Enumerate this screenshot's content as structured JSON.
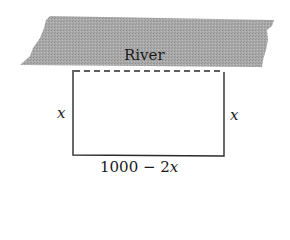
{
  "diagram": {
    "river": {
      "label": "River",
      "fill": "#a8a8a8"
    },
    "rectangle": {
      "left_side_label": "x",
      "right_side_label": "x",
      "bottom_label_number": "1000 − 2",
      "bottom_label_var": "x",
      "river_side_style": "dashed",
      "stroke": "#2a2a2a"
    }
  }
}
